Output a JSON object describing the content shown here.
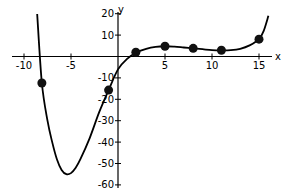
{
  "chart_data": {
    "type": "line",
    "title": "",
    "xlabel": "x",
    "ylabel": "y",
    "xlim": [
      -12.5,
      17.5
    ],
    "ylim": [
      -62,
      22
    ],
    "x_ticks": [
      -10,
      -5,
      5,
      10,
      15
    ],
    "x_tick_labels": [
      "-10",
      "-5",
      "5",
      "10",
      "15"
    ],
    "y_ticks": [
      20,
      10,
      -10,
      -20,
      -30,
      -40,
      -50,
      -60
    ],
    "y_tick_labels": [
      "20",
      "10",
      "-10",
      "-20",
      "-30",
      "-40",
      "-50",
      "-60"
    ],
    "grid": false,
    "legend": null,
    "series": [
      {
        "name": "curve",
        "kind": "line",
        "x": [
          -8.6,
          -8.1,
          -7.5,
          -7,
          -6.5,
          -6,
          -5.5,
          -5,
          -4.5,
          -4,
          -3,
          -2,
          -1,
          0,
          1,
          2,
          3,
          4,
          5,
          6,
          7,
          8,
          9,
          10,
          11,
          12,
          13,
          14,
          15,
          15.5,
          16
        ],
        "y": [
          20,
          -12.4,
          -30,
          -40,
          -48,
          -53,
          -55,
          -54.5,
          -52,
          -48,
          -38,
          -26,
          -15.7,
          -6,
          -1,
          2,
          3.6,
          4.5,
          4.8,
          4.6,
          4.2,
          3.8,
          3.4,
          3.0,
          2.9,
          3.0,
          3.6,
          5.2,
          8.1,
          12,
          19
        ]
      },
      {
        "name": "points",
        "kind": "scatter",
        "x": [
          -8.1,
          -1,
          1.9,
          5,
          8,
          11,
          15
        ],
        "y": [
          -12.4,
          -15.7,
          2,
          4.8,
          3.8,
          2.9,
          8.1
        ]
      }
    ]
  }
}
